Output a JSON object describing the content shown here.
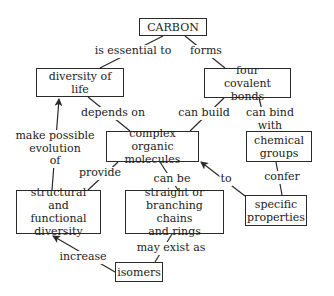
{
  "diagram": {
    "type": "concept-map",
    "colors": {
      "stroke": "#2a2a2a",
      "text": "#222222",
      "background": "#ffffff"
    },
    "nodes": {
      "carbon": {
        "label": "CARBON"
      },
      "diversity_of_life": {
        "label": "diversity of life"
      },
      "four_covalent_bonds": {
        "label": "four\ncovalent bonds"
      },
      "complex_organic_molecules": {
        "label": "complex organic\nmolecules"
      },
      "chemical_groups": {
        "label": "chemical\ngroups"
      },
      "structural_functional_diversity": {
        "label": "structural and\nfunctional\ndiversity"
      },
      "chains_and_rings": {
        "label": "straight or\nbranching chains\nand rings"
      },
      "specific_properties": {
        "label": "specific\nproperties"
      },
      "isomers": {
        "label": "isomers"
      }
    },
    "links": {
      "is_essential_to": {
        "label": "is essential to",
        "from": "CARBON",
        "to": "diversity of life"
      },
      "forms": {
        "label": "forms",
        "from": "CARBON",
        "to": "four covalent bonds"
      },
      "depends_on": {
        "label": "depends on",
        "from": "diversity of life",
        "to": "complex organic molecules"
      },
      "can_build": {
        "label": "can build",
        "from": "four covalent bonds",
        "to": "complex organic molecules"
      },
      "can_bind_with": {
        "label": "can bind with",
        "from": "four covalent bonds",
        "to": "chemical groups"
      },
      "make_possible": {
        "label": "make possible\nevolution\nof",
        "from": "structural and functional diversity",
        "to": "diversity of life"
      },
      "provide": {
        "label": "provide",
        "from": "complex organic molecules",
        "to": "structural and functional diversity"
      },
      "can_be": {
        "label": "can be",
        "from": "complex organic molecules",
        "to": "straight or branching chains and rings"
      },
      "to": {
        "label": "to",
        "from": "specific properties",
        "to": "complex organic molecules"
      },
      "confer": {
        "label": "confer",
        "from": "chemical groups",
        "to": "specific properties"
      },
      "may_exist_as": {
        "label": "may exist as",
        "from": "straight or branching chains and rings",
        "to": "isomers"
      },
      "increase": {
        "label": "increase",
        "from": "isomers",
        "to": "structural and functional diversity"
      }
    }
  }
}
